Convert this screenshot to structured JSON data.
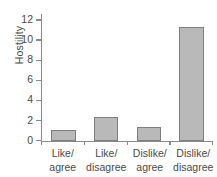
{
  "chart_data": {
    "type": "bar",
    "title": "",
    "xlabel": "",
    "ylabel": "Hostility",
    "categories": [
      "Like/ agree",
      "Like/ disagree",
      "Dislike/ agree",
      "Dislike/ disagree"
    ],
    "category_lines": [
      [
        "Like/",
        "agree"
      ],
      [
        "Like/",
        "disagree"
      ],
      [
        "Dislike/",
        "agree"
      ],
      [
        "Dislike/",
        "disagree"
      ]
    ],
    "values": [
      1.1,
      2.3,
      1.4,
      11.3
    ],
    "ylim": [
      0,
      12.6
    ],
    "yticks": [
      0,
      2,
      4,
      6,
      8,
      10,
      12
    ],
    "ytick_labels": [
      "0",
      "2",
      "4",
      "6",
      "8",
      "10",
      "12"
    ],
    "grid": false,
    "legend": null,
    "bar_color": "#b9b9b9",
    "bar_border_color": "#7e7e7e",
    "axis_color": "#8a8a8a",
    "text_color": "#4a4a4a"
  }
}
